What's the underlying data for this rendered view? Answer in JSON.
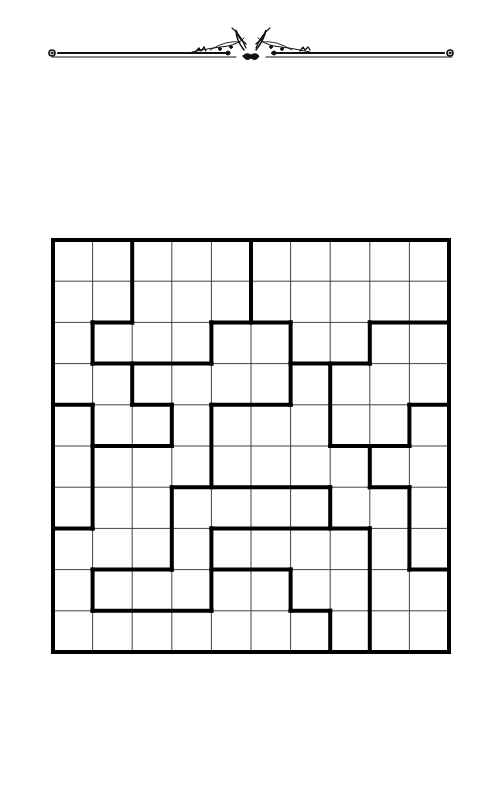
{
  "ornament": {
    "name": "decorative-divider",
    "line_y": 53,
    "x_start": 50,
    "x_end": 452,
    "center_x": 247,
    "color": "#111111"
  },
  "grid": {
    "rows": 10,
    "cols": 10,
    "x0": 53,
    "y0": 240,
    "x1": 449,
    "y1": 652,
    "thin_line_color": "#444444",
    "thick_line_color": "#000000",
    "thin_width": 1,
    "thick_width": 4,
    "cells_empty": true,
    "thick_vertical_segments": [
      {
        "col": 2,
        "from_row": 0,
        "to_row": 2
      },
      {
        "col": 5,
        "from_row": 0,
        "to_row": 2
      },
      {
        "col": 1,
        "from_row": 2,
        "to_row": 3
      },
      {
        "col": 4,
        "from_row": 2,
        "to_row": 3
      },
      {
        "col": 6,
        "from_row": 2,
        "to_row": 4
      },
      {
        "col": 8,
        "from_row": 2,
        "to_row": 3
      },
      {
        "col": 2,
        "from_row": 3,
        "to_row": 4
      },
      {
        "col": 7,
        "from_row": 3,
        "to_row": 5
      },
      {
        "col": 1,
        "from_row": 4,
        "to_row": 7
      },
      {
        "col": 3,
        "from_row": 4,
        "to_row": 5
      },
      {
        "col": 4,
        "from_row": 4,
        "to_row": 6
      },
      {
        "col": 9,
        "from_row": 4,
        "to_row": 5
      },
      {
        "col": 8,
        "from_row": 5,
        "to_row": 6
      },
      {
        "col": 3,
        "from_row": 6,
        "to_row": 8
      },
      {
        "col": 7,
        "from_row": 6,
        "to_row": 7
      },
      {
        "col": 9,
        "from_row": 6,
        "to_row": 8
      },
      {
        "col": 4,
        "from_row": 7,
        "to_row": 9
      },
      {
        "col": 8,
        "from_row": 7,
        "to_row": 10
      },
      {
        "col": 1,
        "from_row": 8,
        "to_row": 9
      },
      {
        "col": 6,
        "from_row": 8,
        "to_row": 9
      },
      {
        "col": 7,
        "from_row": 9,
        "to_row": 10
      }
    ],
    "thick_horizontal_segments": [
      {
        "row": 2,
        "from_col": 1,
        "to_col": 2
      },
      {
        "row": 2,
        "from_col": 4,
        "to_col": 6
      },
      {
        "row": 2,
        "from_col": 8,
        "to_col": 10
      },
      {
        "row": 3,
        "from_col": 1,
        "to_col": 4
      },
      {
        "row": 3,
        "from_col": 6,
        "to_col": 8
      },
      {
        "row": 4,
        "from_col": 0,
        "to_col": 1
      },
      {
        "row": 4,
        "from_col": 2,
        "to_col": 3
      },
      {
        "row": 4,
        "from_col": 4,
        "to_col": 6
      },
      {
        "row": 4,
        "from_col": 9,
        "to_col": 10
      },
      {
        "row": 5,
        "from_col": 1,
        "to_col": 3
      },
      {
        "row": 5,
        "from_col": 7,
        "to_col": 9
      },
      {
        "row": 6,
        "from_col": 3,
        "to_col": 7
      },
      {
        "row": 6,
        "from_col": 8,
        "to_col": 9
      },
      {
        "row": 7,
        "from_col": 0,
        "to_col": 1
      },
      {
        "row": 7,
        "from_col": 4,
        "to_col": 8
      },
      {
        "row": 8,
        "from_col": 1,
        "to_col": 3
      },
      {
        "row": 8,
        "from_col": 4,
        "to_col": 6
      },
      {
        "row": 8,
        "from_col": 9,
        "to_col": 10
      },
      {
        "row": 9,
        "from_col": 1,
        "to_col": 4
      },
      {
        "row": 9,
        "from_col": 6,
        "to_col": 7
      }
    ]
  }
}
